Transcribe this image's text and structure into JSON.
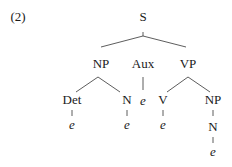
{
  "example_number": "(2)",
  "tree": {
    "root": "S",
    "level1": [
      "NP",
      "Aux",
      "VP"
    ],
    "np_children": [
      "Det",
      "N"
    ],
    "aux_child": "e",
    "vp_children": [
      "V",
      "NP"
    ],
    "det_child": "e",
    "n_child": "e",
    "v_child": "e",
    "vp_np_child": "N",
    "vp_np_n_child": "e"
  }
}
